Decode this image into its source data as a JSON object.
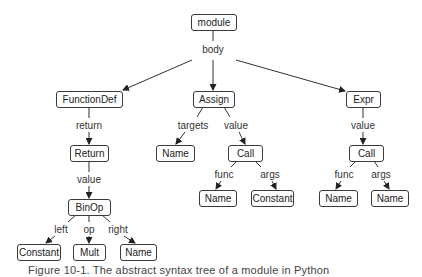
{
  "diagram": {
    "title": "Abstract syntax tree",
    "nodes": [
      {
        "id": "module",
        "label": "module",
        "x": 191,
        "y": 14,
        "w": 45,
        "h": 16
      },
      {
        "id": "functiondef",
        "label": "FunctionDef",
        "x": 56,
        "y": 91,
        "w": 66,
        "h": 16
      },
      {
        "id": "assign",
        "label": "Assign",
        "x": 193,
        "y": 91,
        "w": 41,
        "h": 16
      },
      {
        "id": "expr",
        "label": "Expr",
        "x": 346,
        "y": 91,
        "w": 34,
        "h": 16
      },
      {
        "id": "return",
        "label": "Return",
        "x": 70,
        "y": 145,
        "w": 38,
        "h": 16
      },
      {
        "id": "assign-target-name",
        "label": "Name",
        "x": 156,
        "y": 145,
        "w": 38,
        "h": 16
      },
      {
        "id": "assign-call",
        "label": "Call",
        "x": 228,
        "y": 145,
        "w": 34,
        "h": 16
      },
      {
        "id": "expr-call",
        "label": "Call",
        "x": 349,
        "y": 145,
        "w": 34,
        "h": 16
      },
      {
        "id": "assign-call-func-name",
        "label": "Name",
        "x": 199,
        "y": 190,
        "w": 37,
        "h": 16
      },
      {
        "id": "assign-call-args-constant",
        "label": "Constant",
        "x": 251,
        "y": 190,
        "w": 42,
        "h": 16
      },
      {
        "id": "expr-call-func-name",
        "label": "Name",
        "x": 319,
        "y": 190,
        "w": 38,
        "h": 16
      },
      {
        "id": "expr-call-args-name",
        "label": "Name",
        "x": 371,
        "y": 190,
        "w": 37,
        "h": 16
      },
      {
        "id": "binop",
        "label": "BinOp",
        "x": 68,
        "y": 199,
        "w": 42,
        "h": 16
      },
      {
        "id": "binop-left-constant",
        "label": "Constant",
        "x": 17,
        "y": 244,
        "w": 43,
        "h": 16
      },
      {
        "id": "binop-op-mult",
        "label": "Mult",
        "x": 73,
        "y": 244,
        "w": 32,
        "h": 16
      },
      {
        "id": "binop-right-name",
        "label": "Name",
        "x": 120,
        "y": 244,
        "w": 36,
        "h": 16
      }
    ],
    "edge_labels": [
      {
        "id": "body",
        "label": "body",
        "x": 213,
        "y": 49
      },
      {
        "id": "return",
        "label": "return",
        "x": 89,
        "y": 125
      },
      {
        "id": "targets",
        "label": "targets",
        "x": 193,
        "y": 125
      },
      {
        "id": "assign-value",
        "label": "value",
        "x": 236,
        "y": 125
      },
      {
        "id": "expr-value",
        "label": "value",
        "x": 363,
        "y": 125
      },
      {
        "id": "return-value",
        "label": "value",
        "x": 89,
        "y": 179
      },
      {
        "id": "assign-call-func",
        "label": "func",
        "x": 224,
        "y": 174
      },
      {
        "id": "assign-call-args",
        "label": "args",
        "x": 270,
        "y": 174
      },
      {
        "id": "expr-call-func",
        "label": "func",
        "x": 344,
        "y": 174
      },
      {
        "id": "expr-call-args",
        "label": "args",
        "x": 381,
        "y": 174
      },
      {
        "id": "left",
        "label": "left",
        "x": 61,
        "y": 229
      },
      {
        "id": "op",
        "label": "op",
        "x": 89,
        "y": 229
      },
      {
        "id": "right",
        "label": "right",
        "x": 118,
        "y": 229
      }
    ],
    "edges": [
      {
        "from": "module",
        "to": "body-label",
        "x1": 213,
        "y1": 30,
        "x2": 213,
        "y2": 41,
        "arrow": false
      },
      {
        "from": "body-label",
        "to": "functiondef",
        "x1": 192,
        "y1": 60,
        "x2": 123,
        "y2": 90,
        "arrow": true
      },
      {
        "from": "body-label",
        "to": "assign",
        "x1": 213,
        "y1": 60,
        "x2": 213,
        "y2": 90,
        "arrow": true
      },
      {
        "from": "body-label",
        "to": "expr",
        "x1": 236,
        "y1": 60,
        "x2": 345,
        "y2": 91,
        "arrow": true
      },
      {
        "from": "functiondef",
        "to": "return-label",
        "x1": 89,
        "y1": 107,
        "x2": 89,
        "y2": 118,
        "arrow": false
      },
      {
        "from": "return-label",
        "to": "return",
        "x1": 89,
        "y1": 132,
        "x2": 89,
        "y2": 144,
        "arrow": true
      },
      {
        "from": "assign",
        "to": "targets-label",
        "x1": 203,
        "y1": 107,
        "x2": 197,
        "y2": 117,
        "arrow": false
      },
      {
        "from": "targets-label",
        "to": "assign-target-name",
        "x1": 185,
        "y1": 132,
        "x2": 176,
        "y2": 144,
        "arrow": true
      },
      {
        "from": "assign",
        "to": "assign-value-label",
        "x1": 224,
        "y1": 107,
        "x2": 230,
        "y2": 117,
        "arrow": false
      },
      {
        "from": "assign-value-label",
        "to": "assign-call",
        "x1": 239,
        "y1": 132,
        "x2": 245,
        "y2": 144,
        "arrow": true
      },
      {
        "from": "expr",
        "to": "expr-value-label",
        "x1": 363,
        "y1": 107,
        "x2": 363,
        "y2": 118,
        "arrow": false
      },
      {
        "from": "expr-value-label",
        "to": "expr-call",
        "x1": 363,
        "y1": 132,
        "x2": 363,
        "y2": 144,
        "arrow": true
      },
      {
        "from": "return",
        "to": "return-value-label",
        "x1": 89,
        "y1": 161,
        "x2": 89,
        "y2": 172,
        "arrow": false
      },
      {
        "from": "return-value-label",
        "to": "binop",
        "x1": 89,
        "y1": 186,
        "x2": 89,
        "y2": 198,
        "arrow": true
      },
      {
        "from": "assign-call",
        "to": "func-label",
        "x1": 237,
        "y1": 161,
        "x2": 231,
        "y2": 167,
        "arrow": false
      },
      {
        "from": "func-label",
        "to": "assign-call-func-name",
        "x1": 221,
        "y1": 181,
        "x2": 216,
        "y2": 189,
        "arrow": true
      },
      {
        "from": "assign-call",
        "to": "args-label",
        "x1": 255,
        "y1": 161,
        "x2": 261,
        "y2": 167,
        "arrow": false
      },
      {
        "from": "args-label",
        "to": "assign-call-args-constant",
        "x1": 272,
        "y1": 181,
        "x2": 276,
        "y2": 189,
        "arrow": true
      },
      {
        "from": "expr-call",
        "to": "func-label",
        "x1": 356,
        "y1": 161,
        "x2": 350,
        "y2": 167,
        "arrow": false
      },
      {
        "from": "func-label",
        "to": "expr-call-func-name",
        "x1": 341,
        "y1": 181,
        "x2": 336,
        "y2": 189,
        "arrow": true
      },
      {
        "from": "expr-call",
        "to": "args-label",
        "x1": 374,
        "y1": 161,
        "x2": 378,
        "y2": 167,
        "arrow": false
      },
      {
        "from": "args-label",
        "to": "expr-call-args-name",
        "x1": 384,
        "y1": 181,
        "x2": 389,
        "y2": 189,
        "arrow": true
      },
      {
        "from": "binop",
        "to": "left-label",
        "x1": 76,
        "y1": 215,
        "x2": 68,
        "y2": 222,
        "arrow": false
      },
      {
        "from": "left-label",
        "to": "binop-left-constant",
        "x1": 55,
        "y1": 236,
        "x2": 46,
        "y2": 243,
        "arrow": true
      },
      {
        "from": "binop",
        "to": "op-label",
        "x1": 89,
        "y1": 215,
        "x2": 89,
        "y2": 222,
        "arrow": false
      },
      {
        "from": "op-label",
        "to": "binop-op-mult",
        "x1": 89,
        "y1": 236,
        "x2": 89,
        "y2": 243,
        "arrow": true
      },
      {
        "from": "binop",
        "to": "right-label",
        "x1": 102,
        "y1": 215,
        "x2": 110,
        "y2": 222,
        "arrow": false
      },
      {
        "from": "right-label",
        "to": "binop-right-name",
        "x1": 124,
        "y1": 236,
        "x2": 135,
        "y2": 243,
        "arrow": true
      }
    ]
  },
  "caption": "Figure 10-1. The abstract syntax tree of a module in Python"
}
